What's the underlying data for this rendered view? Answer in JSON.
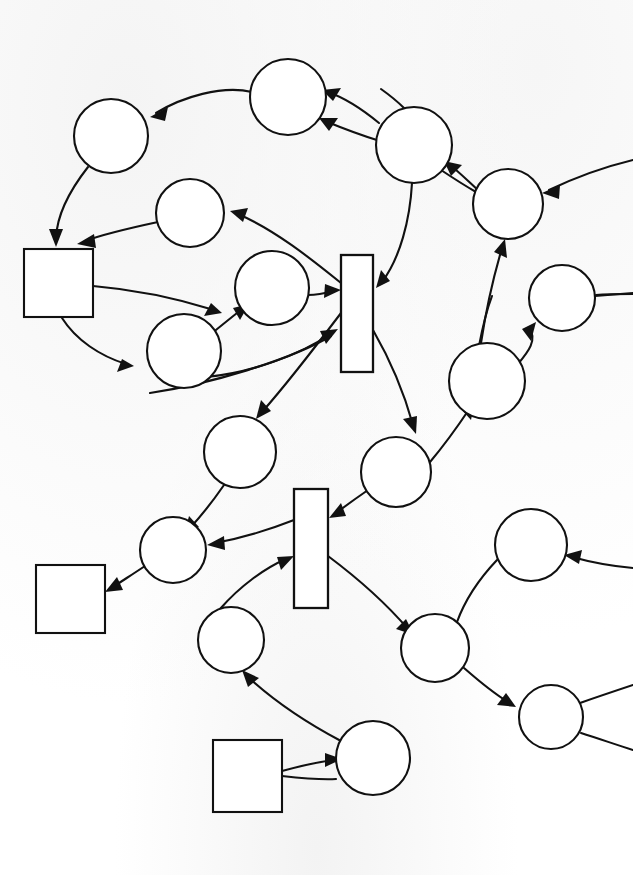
{
  "diagram": {
    "title": "Hand-drawn Petri net style graph",
    "background_color": "#fdfdfd",
    "stroke_color": "#111111",
    "fill_color": "#ffffff",
    "width": 633,
    "height": 875,
    "counts": {
      "places": 20,
      "boxes": 3,
      "transition_bars": 2,
      "arrows": 27
    },
    "places": [
      {
        "id": "p1",
        "label": "",
        "cx": 111,
        "cy": 136,
        "r": 37
      },
      {
        "id": "p2",
        "label": "",
        "cx": 288,
        "cy": 97,
        "r": 38
      },
      {
        "id": "p3",
        "label": "",
        "cx": 414,
        "cy": 145,
        "r": 38
      },
      {
        "id": "p4",
        "label": "",
        "cx": 508,
        "cy": 204,
        "r": 35
      },
      {
        "id": "p5",
        "label": "",
        "cx": 190,
        "cy": 213,
        "r": 34
      },
      {
        "id": "p6",
        "label": "",
        "cx": 272,
        "cy": 288,
        "r": 37
      },
      {
        "id": "p7",
        "label": "",
        "cx": 184,
        "cy": 351,
        "r": 37
      },
      {
        "id": "p8",
        "label": "",
        "cx": 562,
        "cy": 298,
        "r": 33
      },
      {
        "id": "p9",
        "label": "",
        "cx": 487,
        "cy": 381,
        "r": 38
      },
      {
        "id": "p10",
        "label": "",
        "cx": 240,
        "cy": 452,
        "r": 36
      },
      {
        "id": "p11",
        "label": "",
        "cx": 396,
        "cy": 472,
        "r": 35
      },
      {
        "id": "p12",
        "label": "",
        "cx": 173,
        "cy": 550,
        "r": 33
      },
      {
        "id": "p13",
        "label": "",
        "cx": 531,
        "cy": 545,
        "r": 36
      },
      {
        "id": "p14",
        "label": "",
        "cx": 231,
        "cy": 640,
        "r": 33
      },
      {
        "id": "p15",
        "label": "",
        "cx": 435,
        "cy": 648,
        "r": 34
      },
      {
        "id": "p16",
        "label": "",
        "cx": 373,
        "cy": 758,
        "r": 37
      },
      {
        "id": "p17",
        "label": "",
        "cx": 551,
        "cy": 717,
        "r": 32
      }
    ],
    "boxes": [
      {
        "id": "b1",
        "label": "",
        "x": 24,
        "y": 249,
        "w": 69,
        "h": 68
      },
      {
        "id": "b2",
        "label": "",
        "x": 36,
        "y": 565,
        "w": 69,
        "h": 68
      },
      {
        "id": "b3",
        "label": "",
        "x": 213,
        "y": 740,
        "w": 69,
        "h": 72
      }
    ],
    "transition_bars": [
      {
        "id": "t1",
        "label": "",
        "x": 341,
        "y": 255,
        "w": 32,
        "h": 117
      },
      {
        "id": "t2",
        "label": "",
        "x": 294,
        "y": 489,
        "w": 34,
        "h": 119
      }
    ],
    "arrows": [
      {
        "id": "a1",
        "from": "p2",
        "to": "p1",
        "directed": true
      },
      {
        "id": "a2",
        "from": "p3",
        "to": "p2",
        "directed": true
      },
      {
        "id": "a3",
        "from": "p3",
        "to": "p2",
        "directed": true,
        "note": "second parallel arc"
      },
      {
        "id": "a4",
        "from": "p4",
        "to": "p3",
        "directed": true
      },
      {
        "id": "a5",
        "from": "offscreen-right",
        "to": "p4",
        "directed": true
      },
      {
        "id": "a6",
        "from": "p1",
        "to": "b1",
        "directed": true
      },
      {
        "id": "a7",
        "from": "p5",
        "to": "b1",
        "directed": true
      },
      {
        "id": "a8",
        "from": "t1",
        "to": "p5",
        "directed": true
      },
      {
        "id": "a9",
        "from": "b1",
        "to": "p6",
        "directed": true
      },
      {
        "id": "a10",
        "from": "b1",
        "to": "p7",
        "directed": true
      },
      {
        "id": "a11",
        "from": "p7",
        "to": "p6",
        "directed": true
      },
      {
        "id": "a12",
        "from": "p6",
        "to": "t1",
        "directed": true
      },
      {
        "id": "a13",
        "from": "p7",
        "to": "t1",
        "directed": true
      },
      {
        "id": "a14",
        "from": "p3",
        "to": "t1",
        "directed": true
      },
      {
        "id": "a15",
        "from": "t1",
        "to": "p10",
        "directed": true
      },
      {
        "id": "a16",
        "from": "t1",
        "to": "p11",
        "directed": true
      },
      {
        "id": "a17",
        "from": "p9",
        "to": "p4",
        "directed": true
      },
      {
        "id": "a18",
        "from": "p9",
        "to": "p8",
        "directed": true
      },
      {
        "id": "a19",
        "from": "offscreen-right",
        "to": "p8",
        "directed": true
      },
      {
        "id": "a20",
        "from": "p11",
        "to": "p9",
        "directed": true
      },
      {
        "id": "a21",
        "from": "p10",
        "to": "p12",
        "directed": true
      },
      {
        "id": "a22",
        "from": "t2",
        "to": "p12",
        "directed": true
      },
      {
        "id": "a23",
        "from": "p11",
        "to": "t2",
        "directed": true
      },
      {
        "id": "a24",
        "from": "p14",
        "to": "t2",
        "directed": true
      },
      {
        "id": "a25",
        "from": "p12",
        "to": "b2",
        "directed": true
      },
      {
        "id": "a26",
        "from": "t2",
        "to": "p15",
        "directed": true
      },
      {
        "id": "a27",
        "from": "p16",
        "to": "p14",
        "directed": true
      },
      {
        "id": "a28",
        "from": "b3",
        "to": "p16",
        "directed": true
      },
      {
        "id": "a29",
        "from": "p15",
        "to": "p17",
        "directed": true
      },
      {
        "id": "a30",
        "from": "offscreen-right",
        "to": "p13",
        "directed": true
      },
      {
        "id": "a31",
        "from": "p13",
        "to": "offscreen-left-arc",
        "directed": false
      },
      {
        "id": "a32",
        "from": "p17",
        "to": "offscreen-right",
        "directed": false
      },
      {
        "id": "a33",
        "from": "b3",
        "to": "offscreen-right",
        "directed": false
      },
      {
        "id": "a34",
        "from": "p8",
        "to": "offscreen-right",
        "directed": false
      }
    ]
  }
}
